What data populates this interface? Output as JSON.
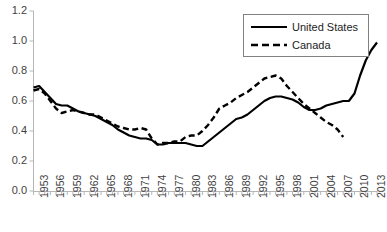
{
  "chart_data": {
    "type": "line",
    "title": "",
    "xlabel": "",
    "ylabel": "",
    "xlim": [
      1953,
      2014
    ],
    "ylim": [
      0.0,
      1.2
    ],
    "grid": false,
    "legend_position": "top-right",
    "ytick_labels": [
      "1.2",
      "1.0",
      "0.8",
      "0.6",
      "0.4",
      "0.2",
      "0.0"
    ],
    "ytick_values": [
      1.2,
      1.0,
      0.8,
      0.6,
      0.4,
      0.2,
      0.0
    ],
    "xtick_labels": [
      "1953",
      "1956",
      "1959",
      "1962",
      "1965",
      "1968",
      "1971",
      "1974",
      "1977",
      "1980",
      "1983",
      "1986",
      "1989",
      "1992",
      "1995",
      "1998",
      "2001",
      "2004",
      "2007",
      "2010",
      "2013"
    ],
    "xtick_values": [
      1953,
      1956,
      1959,
      1962,
      1965,
      1968,
      1971,
      1974,
      1977,
      1980,
      1983,
      1986,
      1989,
      1992,
      1995,
      1998,
      2001,
      2004,
      2007,
      2010,
      2013
    ],
    "x": [
      1953,
      1954,
      1955,
      1956,
      1957,
      1958,
      1959,
      1960,
      1961,
      1962,
      1963,
      1964,
      1965,
      1966,
      1967,
      1968,
      1969,
      1970,
      1971,
      1972,
      1973,
      1974,
      1975,
      1976,
      1977,
      1978,
      1979,
      1980,
      1981,
      1982,
      1983,
      1984,
      1985,
      1986,
      1987,
      1988,
      1989,
      1990,
      1991,
      1992,
      1993,
      1994,
      1995,
      1996,
      1997,
      1998,
      1999,
      2000,
      2001,
      2002,
      2003,
      2004,
      2005,
      2006,
      2007,
      2008,
      2009,
      2010,
      2011,
      2012,
      2013,
      2014
    ],
    "series": [
      {
        "name": "United States",
        "style": "solid",
        "color": "#000000",
        "values": [
          0.69,
          0.7,
          0.66,
          0.62,
          0.58,
          0.57,
          0.57,
          0.55,
          0.53,
          0.52,
          0.51,
          0.5,
          0.48,
          0.46,
          0.44,
          0.41,
          0.39,
          0.37,
          0.36,
          0.35,
          0.35,
          0.34,
          0.31,
          0.31,
          0.32,
          0.32,
          0.32,
          0.32,
          0.31,
          0.3,
          0.3,
          0.33,
          0.36,
          0.39,
          0.42,
          0.45,
          0.48,
          0.49,
          0.51,
          0.54,
          0.57,
          0.6,
          0.62,
          0.63,
          0.63,
          0.62,
          0.61,
          0.59,
          0.56,
          0.54,
          0.54,
          0.55,
          0.57,
          0.58,
          0.59,
          0.6,
          0.6,
          0.65,
          0.77,
          0.87,
          0.94,
          0.99
        ]
      },
      {
        "name": "Canada",
        "style": "dashed",
        "color": "#000000",
        "values": [
          0.67,
          0.68,
          0.65,
          0.6,
          0.55,
          0.52,
          0.53,
          0.54,
          0.53,
          0.52,
          0.51,
          0.51,
          0.49,
          0.47,
          0.45,
          0.43,
          0.42,
          0.41,
          0.41,
          0.42,
          0.41,
          0.35,
          0.31,
          0.32,
          0.32,
          0.33,
          0.33,
          0.36,
          0.37,
          0.37,
          0.4,
          0.44,
          0.49,
          0.55,
          0.57,
          0.59,
          0.62,
          0.64,
          0.66,
          0.69,
          0.72,
          0.75,
          0.76,
          0.77,
          0.75,
          0.7,
          0.66,
          0.62,
          0.58,
          0.55,
          0.52,
          0.49,
          0.46,
          0.44,
          0.41,
          0.36,
          null,
          null,
          null,
          null,
          null,
          null
        ]
      }
    ]
  },
  "legend": {
    "items": [
      {
        "label": "United States",
        "style": "solid"
      },
      {
        "label": "Canada",
        "style": "dashed"
      }
    ]
  }
}
